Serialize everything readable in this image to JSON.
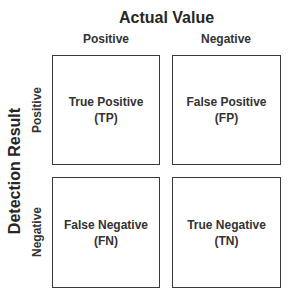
{
  "diagram": {
    "type": "confusion-matrix",
    "title": "Actual Value",
    "y_axis_title": "Detection Result",
    "columns": [
      {
        "label": "Positive"
      },
      {
        "label": "Negative"
      }
    ],
    "rows": [
      {
        "label": "Positive"
      },
      {
        "label": "Negative"
      }
    ],
    "cells": {
      "tp": {
        "name": "True Positive",
        "abbr": "(TP)"
      },
      "fp": {
        "name": "False Positive",
        "abbr": "(FP)"
      },
      "fn": {
        "name": "False Negative",
        "abbr": "(FN)"
      },
      "tn": {
        "name": "True Negative",
        "abbr": "(TN)"
      }
    },
    "colors": {
      "text": "#333333",
      "border": "#3a3a3a",
      "background": "#ffffff"
    }
  }
}
